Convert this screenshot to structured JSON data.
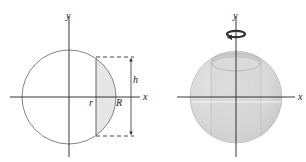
{
  "left_diagram": {
    "axis_x_label": "x",
    "axis_y_label": "y",
    "inner_radius_label": "r",
    "outer_radius_label": "R",
    "height_label": "h",
    "shaded_region_color": "#e6e6e6"
  },
  "right_diagram": {
    "axis_x_label": "x",
    "axis_y_label": "y",
    "rotation_indicator": "rotation-arrow-about-y-axis",
    "sphere_color": "#dcdcdc"
  }
}
